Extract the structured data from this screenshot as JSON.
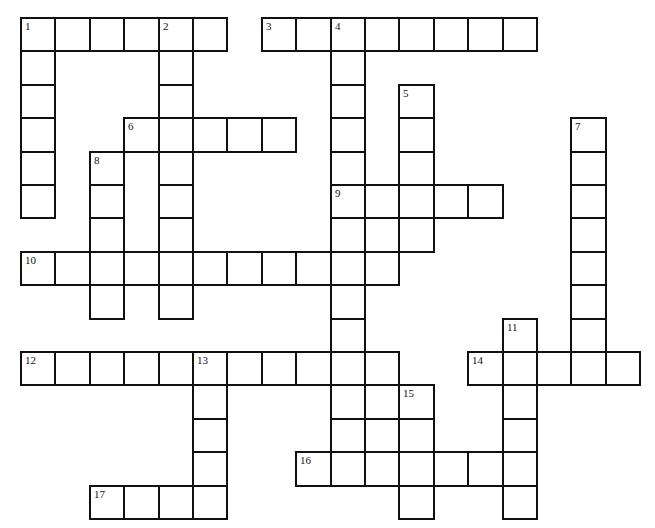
{
  "puzzle": {
    "type": "crossword",
    "grid_origin": {
      "x": 20,
      "y": 17
    },
    "cell_size": {
      "w": 34.4,
      "h": 33.4
    },
    "cells": [
      [
        0,
        0,
        "1"
      ],
      [
        0,
        1
      ],
      [
        0,
        2
      ],
      [
        0,
        3
      ],
      [
        0,
        4,
        "2"
      ],
      [
        0,
        5
      ],
      [
        0,
        7,
        "3"
      ],
      [
        0,
        8
      ],
      [
        0,
        9,
        "4"
      ],
      [
        0,
        10
      ],
      [
        0,
        11
      ],
      [
        0,
        12
      ],
      [
        0,
        13
      ],
      [
        0,
        14
      ],
      [
        1,
        0
      ],
      [
        1,
        4
      ],
      [
        1,
        9
      ],
      [
        2,
        0
      ],
      [
        2,
        4
      ],
      [
        2,
        9
      ],
      [
        2,
        11,
        "5"
      ],
      [
        3,
        0
      ],
      [
        3,
        3,
        "6"
      ],
      [
        3,
        4
      ],
      [
        3,
        5
      ],
      [
        3,
        6
      ],
      [
        3,
        7
      ],
      [
        3,
        9
      ],
      [
        3,
        11
      ],
      [
        3,
        16,
        "7"
      ],
      [
        4,
        0
      ],
      [
        4,
        2,
        "8"
      ],
      [
        4,
        4
      ],
      [
        4,
        9
      ],
      [
        4,
        11
      ],
      [
        4,
        16
      ],
      [
        5,
        0
      ],
      [
        5,
        2
      ],
      [
        5,
        4
      ],
      [
        5,
        9,
        "9"
      ],
      [
        5,
        10
      ],
      [
        5,
        11
      ],
      [
        5,
        12
      ],
      [
        5,
        13
      ],
      [
        5,
        16
      ],
      [
        6,
        2
      ],
      [
        6,
        4
      ],
      [
        6,
        9
      ],
      [
        6,
        10
      ],
      [
        6,
        11
      ],
      [
        6,
        16
      ],
      [
        7,
        0,
        "10"
      ],
      [
        7,
        1
      ],
      [
        7,
        2
      ],
      [
        7,
        3
      ],
      [
        7,
        4
      ],
      [
        7,
        5
      ],
      [
        7,
        6
      ],
      [
        7,
        7
      ],
      [
        7,
        8
      ],
      [
        7,
        9
      ],
      [
        7,
        10
      ],
      [
        7,
        16
      ],
      [
        8,
        2
      ],
      [
        8,
        4
      ],
      [
        8,
        9
      ],
      [
        8,
        16
      ],
      [
        9,
        9
      ],
      [
        9,
        14,
        "11"
      ],
      [
        9,
        16
      ],
      [
        10,
        0,
        "12"
      ],
      [
        10,
        1
      ],
      [
        10,
        2
      ],
      [
        10,
        3
      ],
      [
        10,
        4
      ],
      [
        10,
        5,
        "13"
      ],
      [
        10,
        6
      ],
      [
        10,
        7
      ],
      [
        10,
        8
      ],
      [
        10,
        9
      ],
      [
        10,
        10
      ],
      [
        10,
        13,
        "14"
      ],
      [
        10,
        14
      ],
      [
        10,
        15
      ],
      [
        10,
        16
      ],
      [
        10,
        17
      ],
      [
        11,
        5
      ],
      [
        11,
        9
      ],
      [
        11,
        10
      ],
      [
        11,
        11,
        "15"
      ],
      [
        11,
        14
      ],
      [
        12,
        5
      ],
      [
        12,
        9
      ],
      [
        12,
        10
      ],
      [
        12,
        11
      ],
      [
        12,
        14
      ],
      [
        13,
        5
      ],
      [
        13,
        8,
        "16"
      ],
      [
        13,
        9
      ],
      [
        13,
        10
      ],
      [
        13,
        11
      ],
      [
        13,
        12
      ],
      [
        13,
        13
      ],
      [
        13,
        14
      ],
      [
        14,
        2,
        "17"
      ],
      [
        14,
        3
      ],
      [
        14,
        4
      ],
      [
        14,
        5
      ],
      [
        14,
        11
      ],
      [
        14,
        14
      ]
    ],
    "clue_numbers": [
      "1",
      "2",
      "3",
      "4",
      "5",
      "6",
      "7",
      "8",
      "9",
      "10",
      "11",
      "12",
      "13",
      "14",
      "15",
      "16",
      "17"
    ],
    "across": [
      {
        "number": "1",
        "row": 0,
        "col": 0,
        "length": 6
      },
      {
        "number": "3",
        "row": 0,
        "col": 7,
        "length": 8
      },
      {
        "number": "6",
        "row": 3,
        "col": 3,
        "length": 5
      },
      {
        "number": "9",
        "row": 5,
        "col": 9,
        "length": 5
      },
      {
        "number": "10",
        "row": 7,
        "col": 0,
        "length": 11
      },
      {
        "number": "12",
        "row": 10,
        "col": 0,
        "length": 11
      },
      {
        "number": "14",
        "row": 10,
        "col": 13,
        "length": 5
      },
      {
        "number": "16",
        "row": 13,
        "col": 8,
        "length": 7
      },
      {
        "number": "17",
        "row": 14,
        "col": 2,
        "length": 4
      }
    ],
    "down": [
      {
        "number": "1",
        "row": 0,
        "col": 0,
        "length": 6
      },
      {
        "number": "2",
        "row": 0,
        "col": 4,
        "length": 9
      },
      {
        "number": "4",
        "row": 0,
        "col": 9,
        "length": 14
      },
      {
        "number": "5",
        "row": 2,
        "col": 11,
        "length": 5
      },
      {
        "number": "7",
        "row": 3,
        "col": 16,
        "length": 8
      },
      {
        "number": "8",
        "row": 4,
        "col": 2,
        "length": 5
      },
      {
        "number": "11",
        "row": 9,
        "col": 14,
        "length": 6
      },
      {
        "number": "13",
        "row": 10,
        "col": 5,
        "length": 5
      },
      {
        "number": "15",
        "row": 11,
        "col": 11,
        "length": 4
      }
    ]
  }
}
